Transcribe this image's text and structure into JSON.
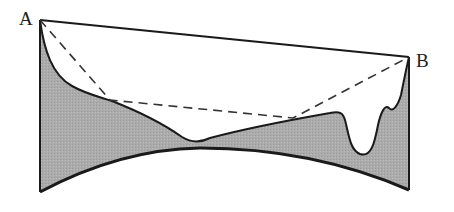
{
  "diagram": {
    "points": {
      "A": {
        "label": "A"
      },
      "B": {
        "label": "B"
      }
    },
    "colors": {
      "terrain_fill": "#aaaaaa",
      "stroke": "#1a1a1a",
      "background": "#ffffff"
    },
    "elements": [
      "straight line A-B (solid)",
      "dashed polyline A to B via two contact points on terrain",
      "shaded terrain region bounded by curved base",
      "curved base arc"
    ]
  }
}
